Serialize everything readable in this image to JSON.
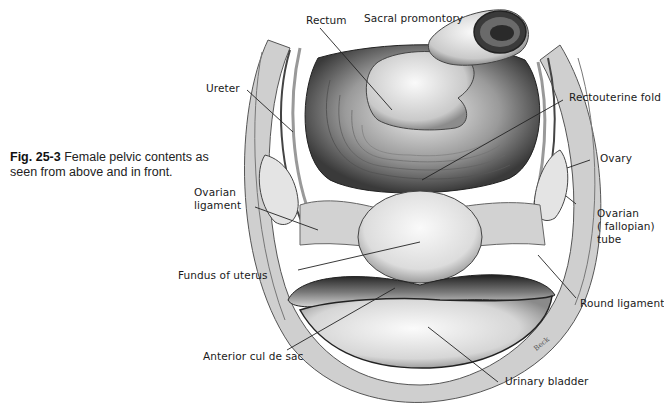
{
  "caption": {
    "figure_number": "Fig. 25-3",
    "text": "Female pelvic contents as seen from above and in front."
  },
  "labels": {
    "rectum": "Rectum",
    "sacral_promontory": "Sacral promontory",
    "ureter": "Ureter",
    "rectouterine_fold": "Rectouterine fold",
    "ovary": "Ovary",
    "ovarian_ligament": "Ovarian\nligament",
    "ovarian_tube": "Ovarian\n( fallopian)\ntube",
    "fundus_of_uterus": "Fundus of uterus",
    "round_ligament": "Round ligament",
    "anterior_cul_de_sac": "Anterior cul de sac",
    "urinary_bladder": "Urinary bladder"
  },
  "artist_signature": "Beck",
  "colors": {
    "background": "#ffffff",
    "ink": "#1a1a1a",
    "shadow": "#3a3a3a",
    "tissue_light": "#e8e8e8",
    "tissue_mid": "#a8a8a8"
  }
}
